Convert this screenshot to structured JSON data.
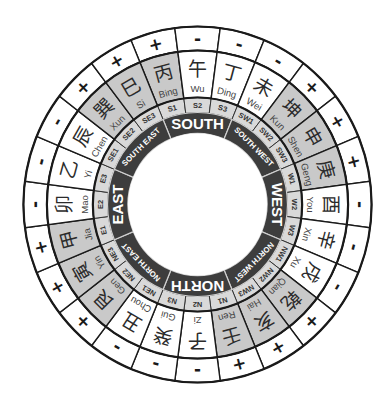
{
  "diagram": {
    "orientation": "South at top",
    "colors": {
      "positive_fill": "#c9c9c9",
      "negative_fill": "#ffffff",
      "sub_ring_fill": "#d9d9d9",
      "direction_ring_fill": "#3d3d3d",
      "center_fill": "#ffffff",
      "line": "#1a1a1a"
    },
    "directions": [
      {
        "label": "SOUTH",
        "type": "main"
      },
      {
        "label": "SOUTH WEST",
        "type": "inter"
      },
      {
        "label": "WEST",
        "type": "main"
      },
      {
        "label": "NORTH WEST",
        "type": "inter"
      },
      {
        "label": "NORTH",
        "type": "main"
      },
      {
        "label": "NORTH EAST",
        "type": "inter"
      },
      {
        "label": "EAST",
        "type": "main"
      },
      {
        "label": "SOUTH EAST",
        "type": "inter"
      }
    ],
    "mountains": [
      {
        "code": "S1",
        "char": "丙",
        "pinyin": "Bing",
        "sign": "+"
      },
      {
        "code": "S2",
        "char": "午",
        "pinyin": "Wu",
        "sign": "-"
      },
      {
        "code": "S3",
        "char": "丁",
        "pinyin": "Ding",
        "sign": "-"
      },
      {
        "code": "SW1",
        "char": "未",
        "pinyin": "Wei",
        "sign": "-"
      },
      {
        "code": "SW2",
        "char": "坤",
        "pinyin": "Kun",
        "sign": "+"
      },
      {
        "code": "SW3",
        "char": "申",
        "pinyin": "Shen",
        "sign": "+"
      },
      {
        "code": "W1",
        "char": "庚",
        "pinyin": "Geng",
        "sign": "+"
      },
      {
        "code": "W2",
        "char": "酉",
        "pinyin": "You",
        "sign": "-"
      },
      {
        "code": "W3",
        "char": "辛",
        "pinyin": "Xin",
        "sign": "-"
      },
      {
        "code": "NW1",
        "char": "戌",
        "pinyin": "Xu",
        "sign": "-"
      },
      {
        "code": "NW2",
        "char": "乾",
        "pinyin": "Qian",
        "sign": "+"
      },
      {
        "code": "NW3",
        "char": "亥",
        "pinyin": "Hai",
        "sign": "+"
      },
      {
        "code": "N1",
        "char": "壬",
        "pinyin": "Ren",
        "sign": "+"
      },
      {
        "code": "N2",
        "char": "子",
        "pinyin": "Zi",
        "sign": "-"
      },
      {
        "code": "N3",
        "char": "癸",
        "pinyin": "Gui",
        "sign": "-"
      },
      {
        "code": "NE1",
        "char": "丑",
        "pinyin": "Chou",
        "sign": "-"
      },
      {
        "code": "NE2",
        "char": "艮",
        "pinyin": "Gen",
        "sign": "+"
      },
      {
        "code": "NE3",
        "char": "寅",
        "pinyin": "Yin",
        "sign": "+"
      },
      {
        "code": "E1",
        "char": "甲",
        "pinyin": "Jia",
        "sign": "+"
      },
      {
        "code": "E2",
        "char": "卯",
        "pinyin": "Mao",
        "sign": "-"
      },
      {
        "code": "E3",
        "char": "乙",
        "pinyin": "Yi",
        "sign": "-"
      },
      {
        "code": "SE1",
        "char": "辰",
        "pinyin": "Chen",
        "sign": "-"
      },
      {
        "code": "SE2",
        "char": "巽",
        "pinyin": "Xun",
        "sign": "+"
      },
      {
        "code": "SE3",
        "char": "巳",
        "pinyin": "Si",
        "sign": "+"
      }
    ]
  }
}
